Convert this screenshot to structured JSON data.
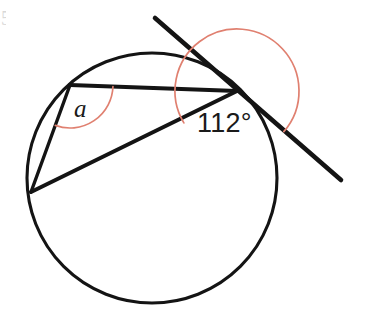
{
  "figure": {
    "canvas": {
      "width": 370,
      "height": 315,
      "background": "#ffffff"
    },
    "stroke_color": "#141414",
    "arc_color": "#e08070"
  },
  "labels": {
    "angle_a": "a",
    "angle_measure": "112°",
    "edge_artifact": "5"
  },
  "chart_data": {
    "type": "diagram",
    "subtype": "circle-geometry",
    "circle": {
      "cx": 152,
      "cy": 178,
      "r": 125,
      "stroke": "#141414",
      "stroke_width": 3.1
    },
    "points": [
      {
        "name": "A",
        "role": "inscribed-angle-vertex",
        "x": 70,
        "y": 85
      },
      {
        "name": "B",
        "role": "lower-left-vertex",
        "x": 31,
        "y": 192
      },
      {
        "name": "T",
        "role": "tangent-point",
        "x": 237,
        "y": 91
      }
    ],
    "segments": [
      {
        "name": "chord-A-T",
        "from": "A",
        "to": "T",
        "x1": 70,
        "y1": 85,
        "x2": 237,
        "y2": 91,
        "stroke_width": 4.0
      },
      {
        "name": "chord-A-B",
        "from": "A",
        "to": "B",
        "x1": 70,
        "y1": 85,
        "x2": 31,
        "y2": 192,
        "stroke_width": 3.4
      },
      {
        "name": "chord-B-T",
        "from": "B",
        "to": "T",
        "x1": 31,
        "y1": 192,
        "x2": 237,
        "y2": 91,
        "stroke_width": 4.0
      }
    ],
    "tangent": {
      "name": "tangent-line",
      "touches_at": "T",
      "x1": 155,
      "y1": 18,
      "x2": 341,
      "y2": 180,
      "stroke_width": 4.6
    },
    "angles": [
      {
        "name": "angle-a",
        "vertex": "A",
        "label": "a",
        "value": null,
        "unit": "degrees",
        "arc_radius": 43,
        "start_deg": 2,
        "end_deg": 110,
        "color": "#e08070",
        "label_x": 83,
        "label_y": 110
      },
      {
        "name": "angle-112",
        "vertex": "T",
        "label": "112°",
        "value": 112,
        "unit": "degrees",
        "arc_radius": 62,
        "start_deg": 149,
        "end_deg": 41,
        "color": "#e08070",
        "label_x": 228,
        "label_y": 124
      }
    ],
    "annotations": [
      "Angle between tangent and chord BT at point T is 112 degrees",
      "Inscribed angle at A subtending chord BT is labelled a"
    ]
  }
}
